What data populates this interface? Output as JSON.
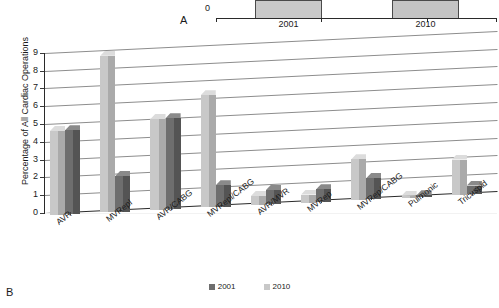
{
  "panel_a": {
    "letter": "A",
    "axis_zero_label": "0",
    "categories": [
      "2001",
      "2010"
    ]
  },
  "panel_b": {
    "letter": "B"
  },
  "colors": {
    "series_2001_face": "#6e6e6e",
    "series_2001_side": "#545454",
    "series_2001_top": "#8a8a8a",
    "series_2010_face": "#c8c8c8",
    "series_2010_side": "#aaaaaa",
    "series_2010_top": "#dcdcdc",
    "gridline": "#8d8d8d",
    "axis": "#2a2a2a"
  },
  "chart_data": {
    "type": "bar",
    "title": "",
    "xlabel": "",
    "ylabel": "Percentage of All Cardiac Operations",
    "ylim": [
      0,
      9
    ],
    "yticks": [
      0,
      1,
      2,
      3,
      4,
      5,
      6,
      7,
      8,
      9
    ],
    "ytick_labels": [
      "0",
      "1",
      "2",
      "3",
      "4",
      "5",
      "6",
      "7",
      "8",
      "9"
    ],
    "grid": true,
    "legend_position": "bottom",
    "categories": [
      "AVR",
      "MVRepl",
      "AVR/CABG",
      "MVRepl/CABG",
      "AVR/MVR",
      "MVRep",
      "MVRep/CABG",
      "Pulmonic",
      "Tricuspid"
    ],
    "series": [
      {
        "name": "2001",
        "values": [
          4.7,
          2.0,
          5.1,
          1.2,
          0.8,
          0.7,
          1.2,
          0.1,
          0.5
        ]
      },
      {
        "name": "2010",
        "values": [
          4.7,
          8.8,
          5.1,
          6.3,
          0.5,
          0.45,
          2.3,
          0.1,
          2.0
        ]
      }
    ],
    "legend": [
      "2001",
      "2010"
    ]
  }
}
